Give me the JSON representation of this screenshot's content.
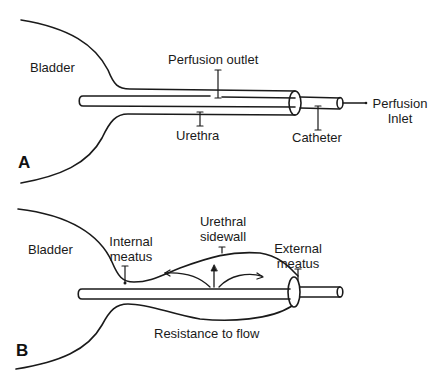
{
  "figure": {
    "line_color": "#1a1a1a",
    "background": "#ffffff",
    "panels": [
      {
        "letter": "A",
        "labels": {
          "bladder": "Bladder",
          "perfusion_outlet": "Perfusion outlet",
          "urethra": "Urethra",
          "catheter": "Catheter",
          "perfusion_inlet_line1": "Perfusion",
          "perfusion_inlet_line2": "Inlet"
        }
      },
      {
        "letter": "B",
        "labels": {
          "bladder": "Bladder",
          "internal_meatus_line1": "Internal",
          "internal_meatus_line2": "meatus",
          "urethral_sidewall_line1": "Urethral",
          "urethral_sidewall_line2": "sidewall",
          "external_meatus_line1": "External",
          "external_meatus_line2": "meatus",
          "resistance": "Resistance to flow"
        }
      }
    ]
  }
}
